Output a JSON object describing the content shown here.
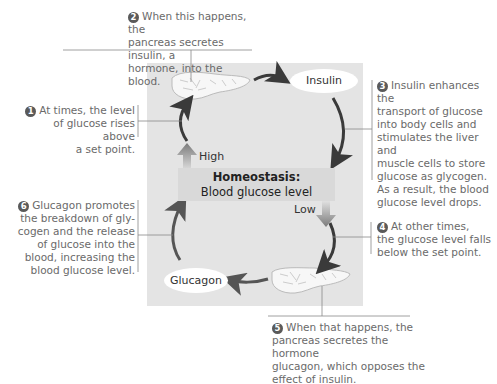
{
  "diagram": {
    "title": "Homeostasis:",
    "subtitle": "Blood glucose level",
    "labels": {
      "high": "High",
      "low": "Low",
      "insulin": "Insulin",
      "glucagon": "Glucagon"
    },
    "steps": [
      {
        "number": "1",
        "text": "At times, the level of glucose rises above a set point.",
        "lines": [
          "At times, the level",
          "of glucose rises above",
          "a set point."
        ]
      },
      {
        "number": "2",
        "text": "When this happens, the pancreas secretes insulin, a hormone, into the blood.",
        "lines": [
          "When this happens, the",
          "pancreas secretes insulin, a",
          "hormone, into the blood."
        ]
      },
      {
        "number": "3",
        "text": "Insulin enhances the transport of glucose into body cells and stimulates the liver and muscle cells to store glucose as glycogen. As a result, the blood glucose level drops.",
        "lines": [
          "Insulin enhances the",
          "transport of glucose",
          "into body cells and",
          "stimulates the liver and",
          "muscle cells to store",
          "glucose as glycogen.",
          "As a result, the blood",
          "glucose level drops."
        ]
      },
      {
        "number": "4",
        "text": "At other times, the glucose level falls below the set point.",
        "lines": [
          "At other times,",
          "the glucose level falls",
          "below the set point."
        ]
      },
      {
        "number": "5",
        "text": "When that happens, the pancreas secretes the hormone glucagon, which opposes the effect of insulin.",
        "lines": [
          "When that happens, the",
          "pancreas secretes the hormone",
          "glucagon, which opposes the",
          "effect of insulin."
        ]
      },
      {
        "number": "6",
        "text": "Glucagon promotes the breakdown of glycogen and the release of glucose into the blood, increasing the blood glucose level.",
        "lines": [
          "Glucagon promotes",
          "the breakdown of gly-",
          "cogen and the release",
          "of glucose into the",
          "blood, increasing the",
          "blood glucose level."
        ]
      }
    ],
    "colors": {
      "panel": "#e4e4e4",
      "center_bar": "#d9d9d9",
      "text": "#6a6a6a",
      "arrow": "#3a3a3a",
      "block_arrow": "#7a7a7a"
    }
  }
}
